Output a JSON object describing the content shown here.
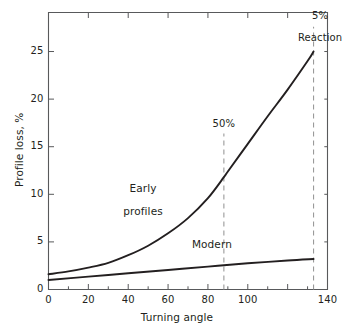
{
  "chart_data": {
    "type": "line",
    "title": "",
    "subtitle": "",
    "xlabel": "Turning angle",
    "ylabel": "Profile loss, %",
    "xlim": [
      0,
      140
    ],
    "ylim": [
      0,
      29.1
    ],
    "grid": false,
    "legend_position": "inline-labels",
    "x_ticks_major": [
      0,
      20,
      40,
      60,
      80,
      100,
      120,
      140
    ],
    "x_tick_labels": [
      "0",
      "20",
      "40",
      "60",
      "80",
      "100",
      "",
      "140"
    ],
    "x_ticks_minor": [
      10,
      30,
      50,
      70,
      90,
      110,
      130
    ],
    "y_ticks_major": [
      0,
      5,
      10,
      15,
      20,
      25
    ],
    "y_tick_labels": [
      "0",
      "5",
      "10",
      "15",
      "20",
      "25"
    ],
    "series": [
      {
        "name": "Early profiles",
        "style": "solid",
        "color": "#231f20",
        "x": [
          0,
          10,
          20,
          30,
          40,
          50,
          60,
          70,
          80,
          88,
          90,
          100,
          110,
          120,
          130,
          133
        ],
        "values": [
          1.6,
          1.9,
          2.3,
          2.8,
          3.6,
          4.6,
          5.9,
          7.5,
          9.6,
          11.8,
          12.4,
          15.3,
          18.2,
          21.0,
          24.0,
          25.0
        ]
      },
      {
        "name": "Modern",
        "style": "solid",
        "color": "#231f20",
        "x": [
          0,
          20,
          40,
          60,
          80,
          88,
          100,
          120,
          133
        ],
        "values": [
          1.0,
          1.35,
          1.7,
          2.05,
          2.4,
          2.55,
          2.75,
          3.05,
          3.2
        ]
      }
    ],
    "annotations": [
      {
        "name": "fifty-percent",
        "text": "50%",
        "x": 88,
        "line_from_y": 0,
        "line_to_y": 16.4,
        "style": "dashed",
        "color": "#9a9a9a"
      },
      {
        "name": "five-percent-reaction",
        "text": "5%\nReaction",
        "x": 133,
        "line_from_y": 0,
        "line_to_y": 27.6,
        "style": "dashed",
        "color": "#9a9a9a"
      }
    ],
    "series_labels": [
      {
        "name": "early-profiles-label",
        "text_line1": "Early",
        "text_line2": "profiles",
        "x": 44,
        "y": 11.2
      },
      {
        "name": "modern-label",
        "text_line1": "Modern",
        "text_line2": "",
        "x": 82,
        "y": 4.6
      }
    ]
  },
  "axis": {
    "x_title": "Turning angle",
    "y_title": "Profile loss, %",
    "x_labels": [
      "0",
      "20",
      "40",
      "60",
      "80",
      "100",
      "140"
    ],
    "y_labels": [
      "25",
      "20",
      "15",
      "10",
      "5",
      "0"
    ]
  },
  "annotations": {
    "fifty_percent": "50%",
    "reaction_pct": "5%",
    "reaction_word": "Reaction"
  },
  "series_text": {
    "early_line1": "Early",
    "early_line2": "profiles",
    "modern": "Modern"
  },
  "colors": {
    "curve": "#231f20",
    "axis": "#58595b",
    "dashed": "#9a9a9a",
    "background": "#ffffff",
    "text": "#231f20"
  }
}
